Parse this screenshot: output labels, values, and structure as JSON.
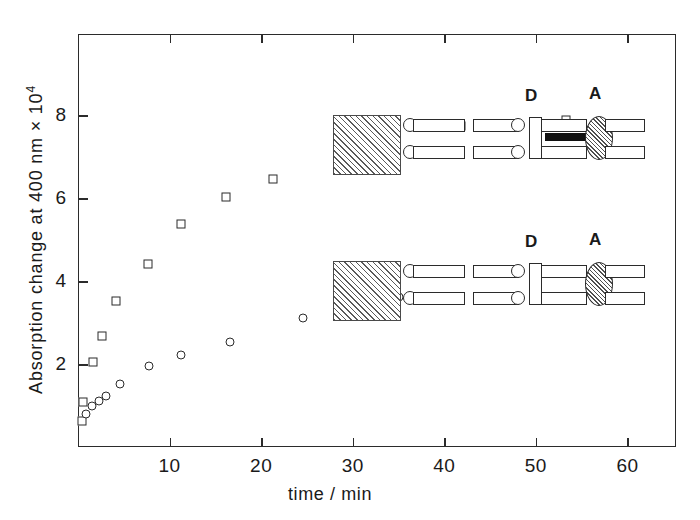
{
  "chart_data": {
    "type": "scatter",
    "title": "",
    "xlabel": "time / min",
    "ylabel": "Absorption change at 400 nm × 10",
    "ylabel_exponent": "4",
    "xlim": [
      0,
      65.3
    ],
    "ylim": [
      0,
      9.95
    ],
    "xticks": [
      10,
      20,
      30,
      40,
      50,
      60
    ],
    "yticks": [
      2,
      4,
      6,
      8
    ],
    "xtick_labels": [
      "10",
      "20",
      "30",
      "40",
      "50",
      "60"
    ],
    "ytick_labels": [
      "2",
      "4",
      "6",
      "8"
    ],
    "grid": false,
    "legend": "none",
    "series": [
      {
        "name": "open-square-series",
        "marker": "open-square",
        "points": [
          [
            0.45,
            0.62
          ],
          [
            0.5,
            1.08
          ],
          [
            1.6,
            2.05
          ],
          [
            2.6,
            2.68
          ],
          [
            4.1,
            3.52
          ],
          [
            7.6,
            4.42
          ],
          [
            11.3,
            5.38
          ],
          [
            16.2,
            6.02
          ],
          [
            21.3,
            6.45
          ],
          [
            31.4,
            7.2
          ],
          [
            41.8,
            7.73
          ],
          [
            53.3,
            7.88
          ]
        ]
      },
      {
        "name": "open-circle-series",
        "marker": "open-circle",
        "points": [
          [
            0.9,
            0.8
          ],
          [
            1.5,
            0.98
          ],
          [
            2.3,
            1.12
          ],
          [
            3.1,
            1.22
          ],
          [
            4.6,
            1.52
          ],
          [
            7.7,
            1.95
          ],
          [
            11.3,
            2.22
          ],
          [
            16.6,
            2.54
          ],
          [
            24.6,
            3.1
          ],
          [
            35.0,
            3.62
          ],
          [
            49.9,
            4.03
          ]
        ]
      }
    ]
  },
  "insets": [
    {
      "id": "inset-upper",
      "donor_label": "D",
      "acceptor_label": "A",
      "has_bridge_bar": true
    },
    {
      "id": "inset-lower",
      "donor_label": "D",
      "acceptor_label": "A",
      "has_bridge_bar": false
    }
  ],
  "colors": {
    "axis": "#2b2b2b",
    "marker_stroke": "#2b2b2b",
    "marker_fill": "#ffffff",
    "hatch": "#5a5a5a",
    "bar": "#111111",
    "background": "#ffffff"
  }
}
